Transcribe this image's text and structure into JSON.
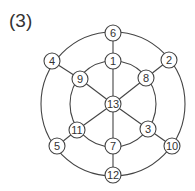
{
  "figure_label": "(3)",
  "diagram": {
    "center": [
      113,
      104
    ],
    "outer_radius": 72,
    "inner_radius": 43,
    "node_radius": 8,
    "stroke_color": "#444444",
    "nodes": [
      {
        "id": "6",
        "x": 113,
        "y": 33
      },
      {
        "id": "1",
        "x": 113,
        "y": 61
      },
      {
        "id": "13",
        "x": 113,
        "y": 104
      },
      {
        "id": "7",
        "x": 113,
        "y": 146
      },
      {
        "id": "12",
        "x": 113,
        "y": 175
      },
      {
        "id": "4",
        "x": 52,
        "y": 61
      },
      {
        "id": "2",
        "x": 169,
        "y": 60
      },
      {
        "id": "9",
        "x": 80,
        "y": 79
      },
      {
        "id": "8",
        "x": 146,
        "y": 78
      },
      {
        "id": "11",
        "x": 77,
        "y": 130
      },
      {
        "id": "3",
        "x": 148,
        "y": 129
      },
      {
        "id": "5",
        "x": 57,
        "y": 146
      },
      {
        "id": "10",
        "x": 172,
        "y": 146
      }
    ],
    "edges": [
      [
        "6",
        "1"
      ],
      [
        "1",
        "13"
      ],
      [
        "13",
        "7"
      ],
      [
        "7",
        "12"
      ],
      [
        "4",
        "9"
      ],
      [
        "9",
        "13"
      ],
      [
        "2",
        "8"
      ],
      [
        "8",
        "13"
      ],
      [
        "5",
        "11"
      ],
      [
        "11",
        "13"
      ],
      [
        "10",
        "3"
      ],
      [
        "3",
        "13"
      ]
    ]
  }
}
